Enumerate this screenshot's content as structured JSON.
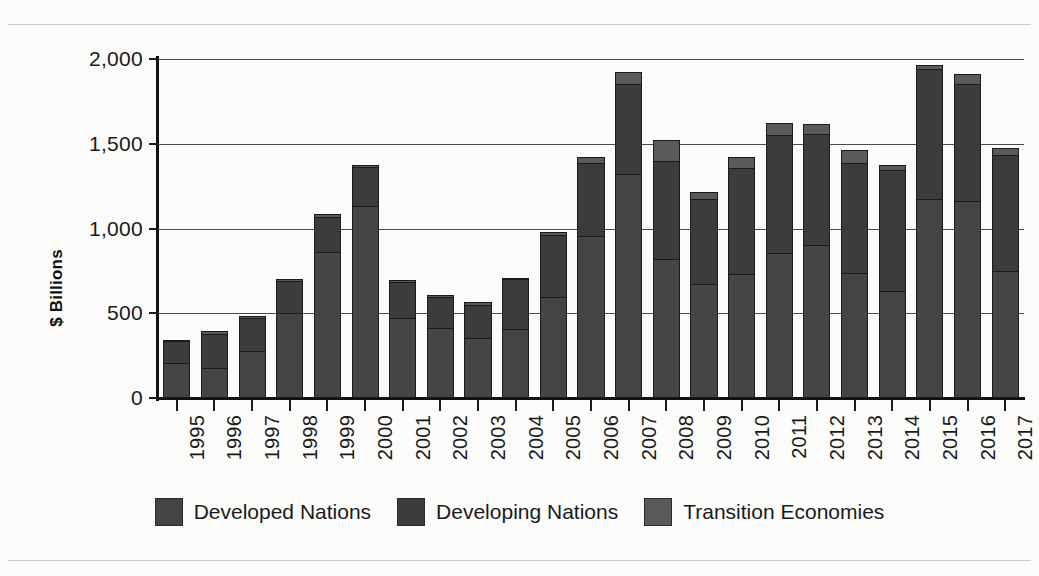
{
  "chart_data": {
    "type": "bar",
    "stacked": true,
    "title": "",
    "subtitle": "",
    "xlabel": "",
    "ylabel": "$ Billions",
    "ylim": [
      0,
      2000
    ],
    "ytick_values": [
      0,
      500,
      1000,
      1500,
      2000
    ],
    "ytick_labels": [
      "0",
      "500",
      "1,000",
      "1,500",
      "2,000"
    ],
    "grid": true,
    "grid_axis": "y",
    "legend_position": "bottom",
    "categories": [
      "1995",
      "1996",
      "1997",
      "1998",
      "1999",
      "2000",
      "2001",
      "2002",
      "2003",
      "2004",
      "2005",
      "2006",
      "2007",
      "2008",
      "2009",
      "2010",
      "2011",
      "2012",
      "2013",
      "2014",
      "2015",
      "2016",
      "2017"
    ],
    "series": [
      {
        "name": "Developed Nations",
        "color": "#454545",
        "values": [
          205,
          180,
          280,
          500,
          860,
          1130,
          470,
          415,
          355,
          405,
          595,
          955,
          1320,
          820,
          670,
          730,
          855,
          900,
          735,
          630,
          1175,
          1165,
          750
        ]
      },
      {
        "name": "Developing Nations",
        "color": "#3c3c3c",
        "values": [
          130,
          200,
          190,
          190,
          210,
          235,
          215,
          180,
          195,
          295,
          365,
          430,
          530,
          580,
          505,
          625,
          695,
          660,
          650,
          715,
          765,
          685,
          685
        ]
      },
      {
        "name": "Transition Economies",
        "color": "#5a5a5a",
        "values": [
          10,
          15,
          15,
          15,
          15,
          10,
          10,
          10,
          15,
          10,
          20,
          40,
          75,
          125,
          40,
          65,
          70,
          55,
          80,
          30,
          25,
          60,
          40
        ]
      }
    ],
    "totals": [
      345,
      395,
      485,
      705,
      1085,
      1375,
      695,
      605,
      565,
      710,
      980,
      1425,
      1925,
      1525,
      1215,
      1420,
      1620,
      1615,
      1465,
      1375,
      1965,
      1910,
      1475
    ]
  },
  "legend": {
    "items": [
      {
        "label": "Developed Nations",
        "swatch": "#454545"
      },
      {
        "label": "Developing Nations",
        "swatch": "#3c3c3c"
      },
      {
        "label": "Transition Economies",
        "swatch": "#5a5a5a"
      }
    ]
  },
  "axes": {
    "y_label": "$ Billions"
  },
  "colors": {
    "background": "#fbfbfa",
    "axis": "#111111",
    "gridline": "#4a4a4a",
    "text": "#1a1a1a"
  }
}
